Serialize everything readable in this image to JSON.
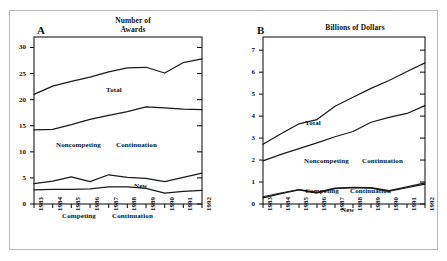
{
  "figure": {
    "background": "#ffffff",
    "frame_color": "#b9b9b9",
    "line_color": "#1a1a1a"
  },
  "panels": [
    {
      "letter": "A",
      "title_line1": "Number of",
      "title_line2": "Awards"
    },
    {
      "letter": "B",
      "title_line1": "Billions of Dollars",
      "title_line2": ""
    }
  ],
  "series_labels": {
    "a_total": "Total",
    "a_noncompeting": "Noncompeting",
    "a_noncompeting2": "Continuation",
    "a_new": "New",
    "a_competing": "Competing",
    "a_competing2": "Continuation",
    "b_total": "Total",
    "b_noncompeting": "Noncompeting",
    "b_noncompeting2": "Continuation",
    "b_competing": "Competing",
    "b_competing2": "Continuation",
    "b_new": "New"
  },
  "chart_data": [
    {
      "type": "line",
      "panel": "A",
      "title": "Number of Awards",
      "xlabel": "",
      "ylabel": "",
      "x": [
        "1983",
        "1984",
        "1985",
        "1986",
        "1987",
        "1988",
        "1989",
        "1990",
        "1991",
        "1992"
      ],
      "ylim": [
        0,
        32
      ],
      "yticks": [
        0,
        5,
        10,
        15,
        20,
        25,
        30
      ],
      "grid": false,
      "legend": "inline-annotations",
      "series": [
        {
          "name": "Total",
          "values": [
            21.0,
            22.6,
            23.5,
            24.3,
            25.3,
            26.1,
            26.2,
            25.1,
            27.1,
            27.8
          ]
        },
        {
          "name": "Noncompeting Continuation",
          "values": [
            14.2,
            14.3,
            15.2,
            16.2,
            17.0,
            17.7,
            18.6,
            18.4,
            18.2,
            18.1
          ]
        },
        {
          "name": "New",
          "values": [
            3.9,
            4.4,
            5.2,
            4.3,
            5.6,
            5.1,
            4.9,
            4.3,
            5.1,
            5.9
          ]
        },
        {
          "name": "Competing Continuation",
          "values": [
            2.7,
            2.8,
            2.8,
            2.9,
            3.3,
            3.3,
            3.0,
            2.1,
            2.4,
            2.6
          ]
        }
      ]
    },
    {
      "type": "line",
      "panel": "B",
      "title": "Billions of Dollars",
      "xlabel": "",
      "ylabel": "",
      "x": [
        "1983",
        "1984",
        "1985",
        "1986",
        "1987",
        "1988",
        "1989",
        "1990",
        "1991",
        "1992"
      ],
      "ylim": [
        0,
        7.6
      ],
      "yticks": [
        0,
        1,
        2,
        3,
        4,
        5,
        6,
        7
      ],
      "grid": false,
      "legend": "inline-annotations",
      "series": [
        {
          "name": "Total",
          "values": [
            2.72,
            3.2,
            3.65,
            3.84,
            4.45,
            4.86,
            5.26,
            5.62,
            6.03,
            6.42
          ]
        },
        {
          "name": "Noncompeting Continuation",
          "values": [
            1.96,
            2.26,
            2.52,
            2.78,
            3.06,
            3.3,
            3.72,
            3.94,
            4.12,
            4.48
          ]
        },
        {
          "name": "Competing Continuation",
          "values": [
            0.33,
            0.5,
            0.66,
            0.53,
            0.72,
            0.76,
            0.74,
            0.61,
            0.78,
            0.96
          ]
        },
        {
          "name": "New",
          "values": [
            0.28,
            0.47,
            0.64,
            0.5,
            0.7,
            0.74,
            0.72,
            0.58,
            0.74,
            0.9
          ]
        }
      ]
    }
  ]
}
